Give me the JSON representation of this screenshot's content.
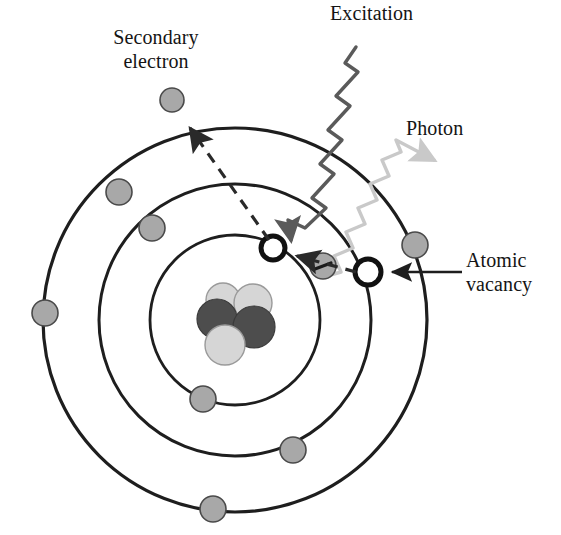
{
  "figure": {
    "background_color": "#ffffff"
  },
  "labels": {
    "secondary_electron": "Secondary\nelectron",
    "excitation": "Excitation",
    "photon": "Photon",
    "atomic_vacancy": "Atomic\nvacancy"
  },
  "colors": {
    "outline": "#1e1e1e",
    "electron_fill": "#a8a8a8",
    "electron_stroke": "#4a4a4a",
    "nucleon_light": "#d4d4d4",
    "nucleon_dark": "#4d4d4d",
    "nucleon_stroke": "#6b6b6b",
    "excitation_wave": "#5a5a5a",
    "photon_wave": "#c9c9c9",
    "vacancy_ring": "#111111",
    "dashed_arrow": "#2a2a2a",
    "pointer_line": "#1e1e1e"
  },
  "atom": {
    "center": {
      "x": 235,
      "y": 320
    },
    "shells": [
      {
        "name": "inner-shell",
        "radius": 85
      },
      {
        "name": "middle-shell",
        "radius": 136
      },
      {
        "name": "outer-shell",
        "radius": 192
      }
    ]
  },
  "nucleus": {
    "center": {
      "x": 234,
      "y": 322
    },
    "nucleons": [
      {
        "name": "nucleon-light-top-left",
        "cx": 223,
        "cy": 300,
        "r": 17,
        "shade": "light"
      },
      {
        "name": "nucleon-light-top-right",
        "cx": 253,
        "cy": 303,
        "r": 19,
        "shade": "light"
      },
      {
        "name": "nucleon-dark-left",
        "cx": 217,
        "cy": 319,
        "r": 20,
        "shade": "dark"
      },
      {
        "name": "nucleon-dark-right",
        "cx": 254,
        "cy": 327,
        "r": 21,
        "shade": "dark"
      },
      {
        "name": "nucleon-light-bottom",
        "cx": 225,
        "cy": 345,
        "r": 20,
        "shade": "light"
      }
    ]
  },
  "electrons": [
    {
      "name": "electron-outer-upper-left",
      "cx": 119,
      "cy": 192,
      "r": 13,
      "shell": "outer-shell"
    },
    {
      "name": "electron-outer-left",
      "cx": 45,
      "cy": 313,
      "r": 13,
      "shell": "outer-shell"
    },
    {
      "name": "electron-outer-bottom",
      "cx": 213,
      "cy": 509,
      "r": 13,
      "shell": "outer-shell"
    },
    {
      "name": "electron-outer-right",
      "cx": 415,
      "cy": 245,
      "r": 13,
      "shell": "outer-shell"
    },
    {
      "name": "electron-middle-upper-left",
      "cx": 152,
      "cy": 228,
      "r": 13,
      "shell": "middle-shell"
    },
    {
      "name": "electron-middle-bottom-right",
      "cx": 293,
      "cy": 450,
      "r": 13,
      "shell": "middle-shell"
    },
    {
      "name": "electron-inner-bottom",
      "cx": 203,
      "cy": 399,
      "r": 13,
      "shell": "inner-shell"
    },
    {
      "name": "electron-secondary-emitted",
      "cx": 172,
      "cy": 100,
      "r": 12,
      "shell": "free"
    }
  ],
  "transition_electron": {
    "name": "electron-transitioning",
    "cx": 323,
    "cy": 266,
    "r": 13,
    "charge_symbol": "minus"
  },
  "vacancies": [
    {
      "name": "vacancy-inner-shell",
      "cx": 273,
      "cy": 248,
      "r": 12
    },
    {
      "name": "vacancy-outer-position",
      "cx": 368,
      "cy": 272,
      "r": 13
    }
  ],
  "waves": [
    {
      "name": "excitation-wave",
      "label": "Excitation",
      "color": "#5a5a5a",
      "from": {
        "x": 356,
        "y": 47
      },
      "to": {
        "x": 285,
        "y": 238
      },
      "arrow": "down-left"
    },
    {
      "name": "photon-wave",
      "label": "Photon",
      "color": "#c9c9c9",
      "from": {
        "x": 327,
        "y": 274
      },
      "to": {
        "x": 438,
        "y": 155
      },
      "arrow": "up-right"
    }
  ],
  "arrows": [
    {
      "name": "secondary-electron-arrow",
      "style": "dashed",
      "from": {
        "x": 271,
        "y": 243
      },
      "to": {
        "x": 185,
        "y": 123
      }
    },
    {
      "name": "electron-transition-arrow",
      "style": "dashed",
      "from": {
        "x": 356,
        "y": 271
      },
      "to": {
        "x": 290,
        "y": 254
      }
    },
    {
      "name": "atomic-vacancy-pointer",
      "style": "solid",
      "from": {
        "x": 462,
        "y": 272
      },
      "to": {
        "x": 387,
        "y": 272
      }
    }
  ]
}
